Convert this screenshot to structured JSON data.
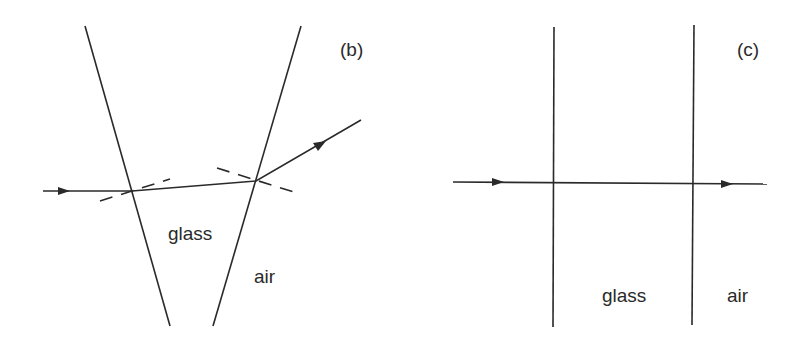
{
  "panels": [
    {
      "id": "b",
      "tag": "(b)",
      "labels": {
        "inside": "glass",
        "outside": "air"
      },
      "description": "Ray refracting through a wedge-shaped glass prism with dashed normals at each surface"
    },
    {
      "id": "c",
      "tag": "(c)",
      "labels": {
        "inside": "glass",
        "outside": "air"
      },
      "description": "Ray passing undeviated through a parallel-sided glass slab at normal incidence"
    }
  ],
  "colors": {
    "ink": "#2a2a2a",
    "background": "#ffffff"
  }
}
